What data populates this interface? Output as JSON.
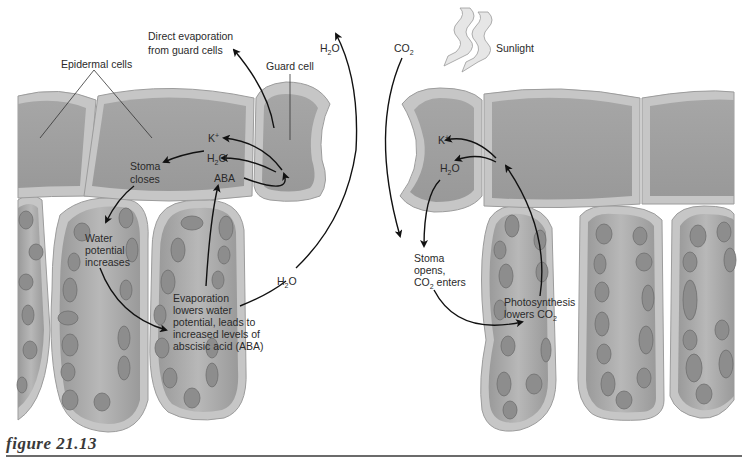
{
  "figure": {
    "caption": "figure 21.13",
    "left_panel": {
      "title_context": "Stoma closing",
      "labels": {
        "epidermal_cells": "Epidermal cells",
        "direct_evap_line1": "Direct evaporation",
        "direct_evap_line2": "from guard cells",
        "guard_cell": "Guard cell",
        "h2o_top": "H",
        "h2o_top_sub": "2",
        "h2o_top_o": "O",
        "k_ion": "K",
        "k_sup": "+",
        "h2o_mid": "H",
        "h2o_mid_sub": "2",
        "h2o_mid_o": "O",
        "aba": "ABA",
        "stoma_closes_1": "Stoma",
        "stoma_closes_2": "closes",
        "water_pot_1": "Water",
        "water_pot_2": "potential",
        "water_pot_3": "increases",
        "evap_1": "Evaporation",
        "evap_2": "lowers water",
        "evap_3": "potential, leads to",
        "evap_4": "increased levels of",
        "evap_5": "abscisic acid (ABA)",
        "h2o_side": "H",
        "h2o_side_sub": "2",
        "h2o_side_o": "O"
      }
    },
    "right_panel": {
      "title_context": "Stoma opening",
      "labels": {
        "co2_top": "CO",
        "co2_top_sub": "2",
        "sunlight": "Sunlight",
        "k_ion": "K",
        "k_sup": "+",
        "h2o": "H",
        "h2o_sub": "2",
        "h2o_o": "O",
        "stoma_opens_1": "Stoma",
        "stoma_opens_2": "opens,",
        "stoma_opens_3a": "CO",
        "stoma_opens_3sub": "2",
        "stoma_opens_3b": " enters",
        "photo_1": "Photosynthesis",
        "photo_2a": "lowers CO",
        "photo_2sub": "2"
      }
    },
    "colors": {
      "cell_wall": "#c4c4c4",
      "cell_wall_outer": "#a9a9a9",
      "cytoplasm": "#9e9e9e",
      "cytoplasm_light": "#b3b3b3",
      "chloroplast": "#8a8a8a",
      "arrow": "#111111",
      "text": "#2a2a2a"
    }
  }
}
